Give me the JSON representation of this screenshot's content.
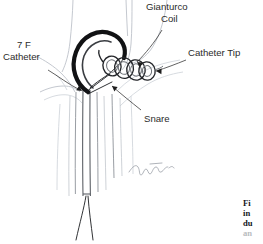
{
  "figure": {
    "background_color": "#ffffff",
    "ink_color": "#2b2b2b",
    "width": 263,
    "height": 244
  },
  "labels": {
    "gianturco_coil": {
      "line1": "Gianturco",
      "line2": "Coil"
    },
    "catheter_tip": "Catheter Tip",
    "catheter_7f": {
      "line1": "7 F",
      "line2": "Catheter"
    },
    "snare": "Snare"
  },
  "artist_signature": {
    "present": true,
    "name": "signature-mark"
  },
  "caption": {
    "lines": [
      "Fi",
      "in",
      "du",
      "an"
    ],
    "truncated": true
  },
  "icons": {
    "arrowhead": "arrowhead-icon",
    "leader_line": "leader-line-icon"
  }
}
